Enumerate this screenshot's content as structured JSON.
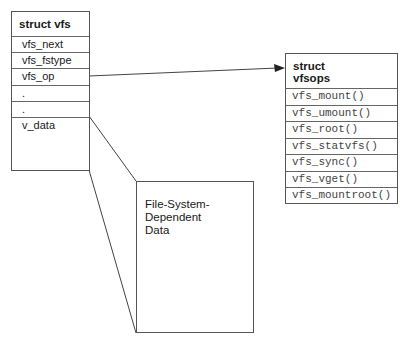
{
  "struct_vfs": {
    "title": "struct vfs",
    "fields": [
      "vfs_next",
      "vfs_fstype",
      "vfs_op",
      ".",
      ".",
      "v_data"
    ]
  },
  "struct_vfsops": {
    "title_line1": "struct",
    "title_line2": "vfsops",
    "functions": [
      "vfs_mount()",
      "vfs_umount()",
      "vfs_root()",
      "vfs_statvfs()",
      "vfs_sync()",
      "vfs_vget()",
      "vfs_mountroot()"
    ]
  },
  "fs_dependent": {
    "label": "File-System-\nDependent\nData"
  },
  "connectors": {
    "vfs_op_to_vfsops": "arrow",
    "v_data_to_fs_data": "trapezoid-lines"
  },
  "colors": {
    "line": "#555555",
    "text": "#1a1a1a",
    "mono_text": "#444444"
  }
}
